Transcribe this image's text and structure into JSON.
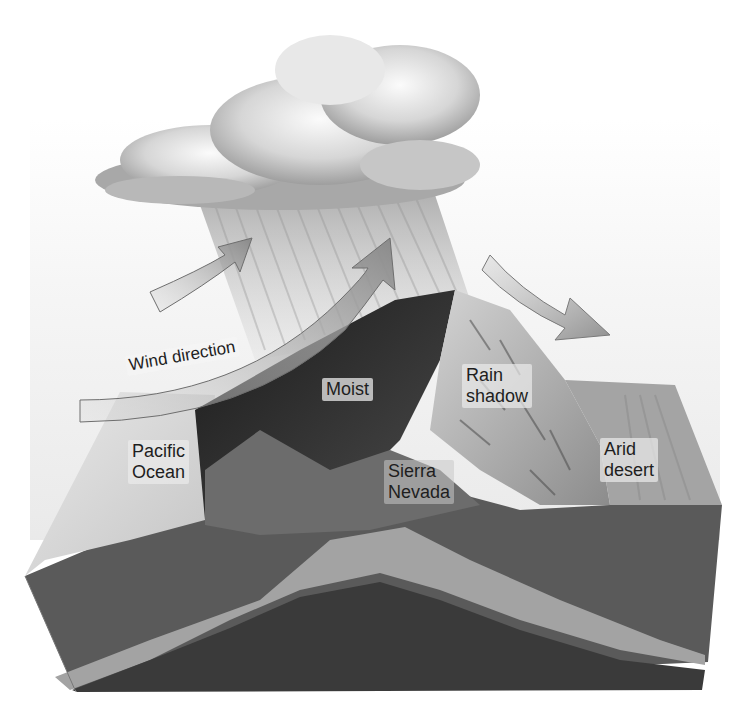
{
  "diagram": {
    "labels": {
      "wind_direction": "Wind direction",
      "pacific_ocean": "Pacific\nOcean",
      "moist": "Moist",
      "rain_shadow": "Rain\nshadow",
      "sierra_nevada": "Sierra\nNevada",
      "arid_desert": "Arid\ndesert"
    },
    "elements": {
      "cloud": "rain-cloud",
      "rain": "rain-shafts",
      "arrows": [
        "wind-arrow-upper",
        "wind-arrow-rising",
        "wind-arrow-descending"
      ],
      "terrain": "mountain-cross-section"
    },
    "colors": {
      "background": "#ffffff",
      "sky": "#efefef",
      "cloud": "#bdbdbd",
      "arrow": "#8c8c8c",
      "moist_slope": "#2a2a2a",
      "dry_slope": "#a8a8a8",
      "ocean": "#dcdcdc",
      "desert": "#9a9a9a",
      "crust_top": "#5e5e5e",
      "crust_band": "#a0a0a0",
      "crust_base": "#3f3f3f"
    }
  }
}
